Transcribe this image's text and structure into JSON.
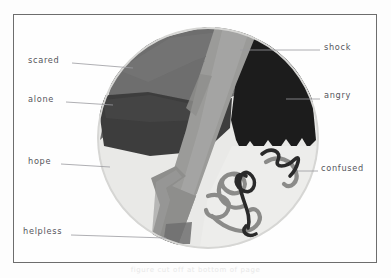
{
  "artwork": {
    "title": "emotion-wheel-collage",
    "medium": "hand-drawn collage on paper inside pencil frame",
    "background_color": "#fdfdfd",
    "frame_color": "#6d6d6d",
    "leader_line_color": "#8f8f96",
    "label_color": "#55555c"
  },
  "labels": [
    {
      "id": "scared",
      "text": "scared",
      "side": "left",
      "x": 28,
      "y": 60,
      "line": {
        "x1": 72,
        "y1": 63,
        "x2": 133,
        "y2": 68
      }
    },
    {
      "id": "alone",
      "text": "alone",
      "side": "left",
      "x": 28,
      "y": 99,
      "line": {
        "x1": 66,
        "y1": 102,
        "x2": 113,
        "y2": 105
      }
    },
    {
      "id": "hope",
      "text": "hope",
      "side": "left",
      "x": 28,
      "y": 161,
      "line": {
        "x1": 61,
        "y1": 164,
        "x2": 110,
        "y2": 167
      }
    },
    {
      "id": "helpless",
      "text": "helpless",
      "side": "left",
      "x": 23,
      "y": 231,
      "line": {
        "x1": 71,
        "y1": 235,
        "x2": 166,
        "y2": 238
      }
    },
    {
      "id": "shock",
      "text": "shock",
      "side": "right",
      "x": 324,
      "y": 47,
      "line": {
        "x1": 240,
        "y1": 50,
        "x2": 320,
        "y2": 50
      }
    },
    {
      "id": "angry",
      "text": "angry",
      "side": "right",
      "x": 324,
      "y": 95,
      "line": {
        "x1": 286,
        "y1": 99,
        "x2": 320,
        "y2": 99
      }
    },
    {
      "id": "confused",
      "text": "confused",
      "side": "right",
      "x": 321,
      "y": 168,
      "line": {
        "x1": 297,
        "y1": 171,
        "x2": 318,
        "y2": 171
      }
    }
  ],
  "segments": [
    {
      "id": "scared-region",
      "label": "scared",
      "color": "#6b6b6b",
      "tone": "mid-dark-gray",
      "position": "upper-left"
    },
    {
      "id": "alone-region",
      "label": "alone",
      "color": "#3f3f3f",
      "tone": "dark-gray",
      "position": "left"
    },
    {
      "id": "hope-region",
      "label": "hope",
      "color": "#e6e6e4",
      "tone": "very-light",
      "position": "lower-left"
    },
    {
      "id": "shock-region",
      "label": "shock",
      "color": "#9a9a98",
      "tone": "mid-gray-band",
      "position": "diagonal-band"
    },
    {
      "id": "angry-region",
      "label": "angry",
      "color": "#1d1d1d",
      "tone": "near-black",
      "position": "right"
    },
    {
      "id": "confused-region",
      "label": "confused",
      "color": "#ececea",
      "tone": "light-with-squiggles",
      "position": "lower-right"
    },
    {
      "id": "helpless-region",
      "label": "helpless",
      "color": "#8d8d8b",
      "tone": "mid-gray-band-lower",
      "position": "bottom-band"
    }
  ],
  "squiggles": {
    "description": "tangled scribble lines inside the confused region",
    "dark_color": "#2b2b2b",
    "mid_color": "#8b8b89",
    "count": 6
  },
  "caption": {
    "text": "figure cut off at bottom of page"
  }
}
